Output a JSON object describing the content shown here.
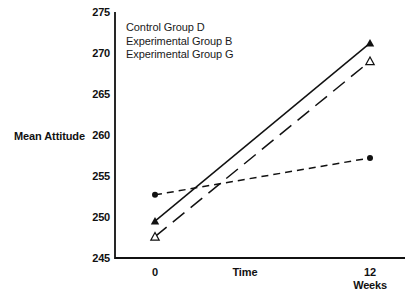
{
  "chart_data": {
    "type": "line",
    "title": "",
    "xlabel": "Time",
    "ylabel": "Mean Attitude",
    "x_unit_label": "Weeks",
    "x": [
      0,
      12
    ],
    "xtick_labels": [
      "0",
      "12"
    ],
    "ylim": [
      245,
      275
    ],
    "ytick_labels": [
      "275",
      "270",
      "265",
      "260",
      "255",
      "250",
      "245"
    ],
    "ytick_values": [
      275,
      270,
      265,
      260,
      255,
      250,
      245
    ],
    "grid": false,
    "legend_position": "upper-left-inside",
    "series": [
      {
        "name": "Control Group D",
        "values": [
          252.7,
          257.2
        ],
        "marker": "filled-circle",
        "line_style": "short-dash",
        "color": "#111111"
      },
      {
        "name": "Experimental Group B",
        "values": [
          249.5,
          271.2
        ],
        "marker": "filled-triangle",
        "line_style": "solid",
        "color": "#111111"
      },
      {
        "name": "Experimental Group G",
        "values": [
          247.6,
          269.0
        ],
        "marker": "open-triangle",
        "line_style": "long-dash",
        "color": "#111111"
      }
    ]
  },
  "legend": {
    "entries": [
      "Control Group D",
      "Experimental Group B",
      "Experimental Group G"
    ]
  },
  "colors": {
    "ink": "#111111",
    "background": "#ffffff"
  }
}
